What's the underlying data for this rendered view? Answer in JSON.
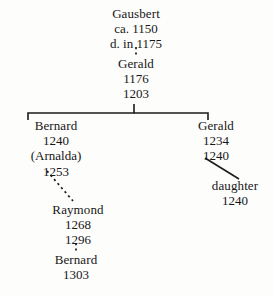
{
  "diagram": {
    "line_color": "#1b1b1b",
    "background_color": "#fdfdfc",
    "text_color": "#171717"
  },
  "nodes": {
    "gausbert": {
      "name": "Gausbert",
      "line2": "ca.  1150",
      "line3": "d.  in 1175"
    },
    "gerald_1176": {
      "name": "Gerald",
      "line2": "1176",
      "line3": "1203"
    },
    "bernard_1240": {
      "name": "Bernard",
      "line2": "1240",
      "line3": "(Arnalda)",
      "line4": "1253"
    },
    "gerald_1234": {
      "name": "Gerald",
      "line2": "1234",
      "line3": "1240"
    },
    "daughter_1240": {
      "name": "daughter",
      "line2": "1240"
    },
    "raymond_1268": {
      "name": "Raymond",
      "line2": "1268",
      "line3": "1296"
    },
    "bernard_1303": {
      "name": "Bernard",
      "line2": "1303"
    }
  },
  "connectors": [
    {
      "id": "gausbert-to-gerald",
      "style": "dashed",
      "from": "gausbert",
      "to": "gerald_1176"
    },
    {
      "id": "gerald-sibling-bracket",
      "style": "solid",
      "from": "gerald_1176",
      "to": "bernard_1240, gerald_1234"
    },
    {
      "id": "gerald-to-daughter",
      "style": "solid",
      "from": "gerald_1234",
      "to": "daughter_1240"
    },
    {
      "id": "bernard-to-raymond",
      "style": "dashed",
      "from": "bernard_1240",
      "to": "raymond_1268"
    },
    {
      "id": "raymond-to-bernard",
      "style": "dashed",
      "from": "raymond_1268",
      "to": "bernard_1303"
    }
  ]
}
